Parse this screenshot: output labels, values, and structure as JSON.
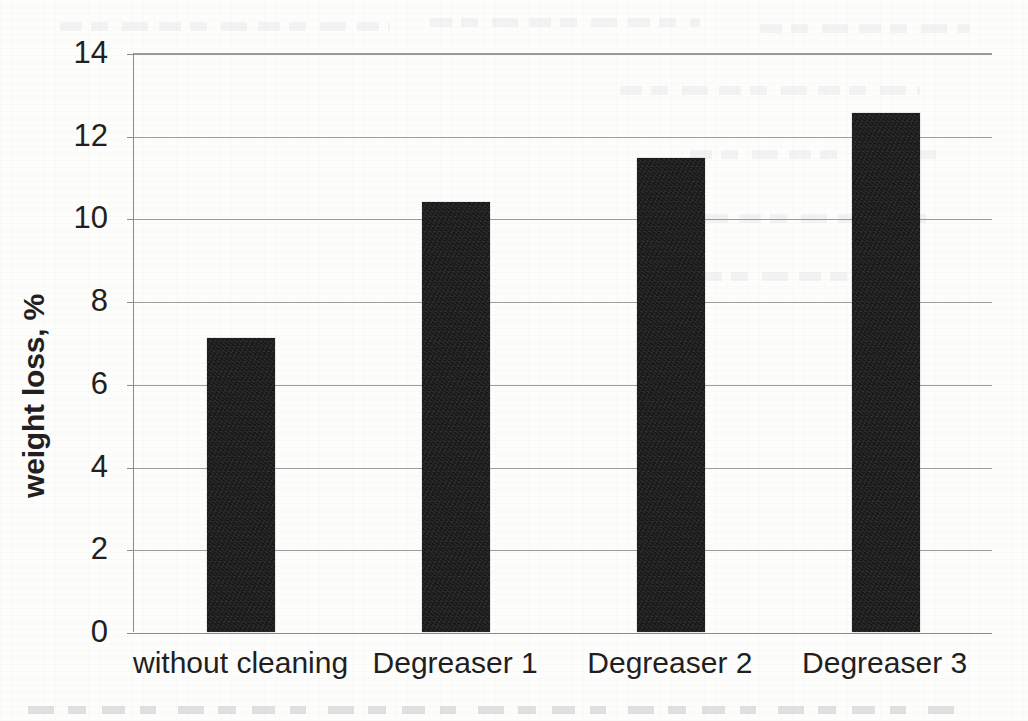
{
  "chart_data": {
    "type": "bar",
    "title": "",
    "xlabel": "",
    "ylabel": "weight loss, %",
    "categories": [
      "without cleaning",
      "Degreaser 1",
      "Degreaser 2",
      "Degreaser 3"
    ],
    "values": [
      7.1,
      10.4,
      11.45,
      12.55
    ],
    "ylim": [
      0,
      14
    ],
    "ytick_step": 2,
    "yticks": [
      "14",
      "12",
      "10",
      "8",
      "6",
      "4",
      "2",
      "0"
    ],
    "ytick_values": [
      14,
      12,
      10,
      8,
      6,
      4,
      2,
      0
    ],
    "grid": true,
    "grid_axis": "y",
    "legend": false,
    "bar_color": "#191919",
    "grid_color": "#9c9c9c",
    "axis_color": "#8d8d8d",
    "text_color": "#231f20",
    "background": "#fdfdfc"
  }
}
